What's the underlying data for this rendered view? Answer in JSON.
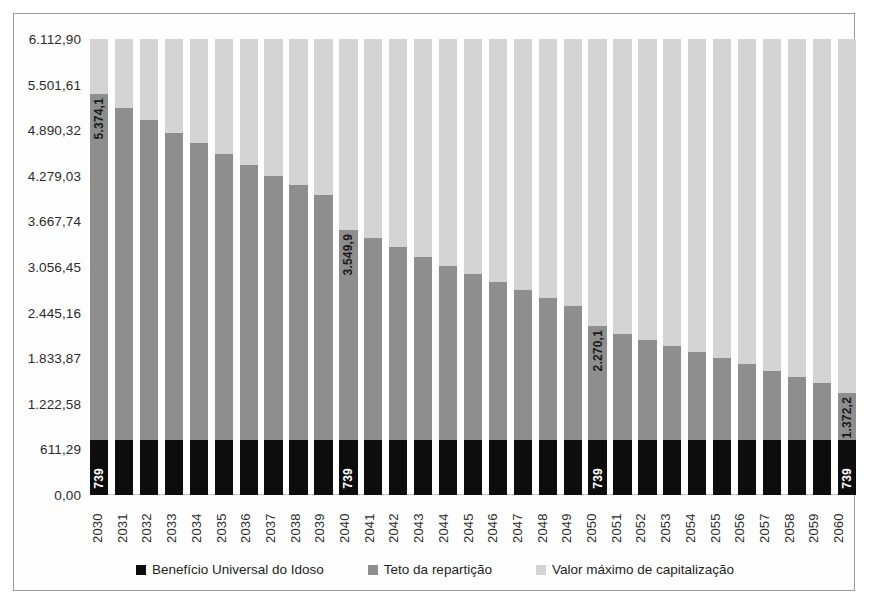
{
  "chart_data": {
    "type": "bar",
    "subtype": "stacked-column",
    "title": "",
    "xlabel": "",
    "ylabel": "",
    "ylim": [
      0,
      6112.9
    ],
    "ytick_labels": [
      "0,00",
      "611,29",
      "1.222,58",
      "1.833,87",
      "2.445,16",
      "3.056,45",
      "3.667,74",
      "4.279,03",
      "4.890,32",
      "5.501,61",
      "6.112,90"
    ],
    "ytick_values": [
      0,
      611.29,
      1222.58,
      1833.87,
      2445.16,
      3056.45,
      3667.74,
      4279.03,
      4890.32,
      5501.61,
      6112.9
    ],
    "grid": false,
    "legend_position": "bottom",
    "categories": [
      "2030",
      "2031",
      "2032",
      "2033",
      "2034",
      "2035",
      "2036",
      "2037",
      "2038",
      "2039",
      "2040",
      "2041",
      "2042",
      "2043",
      "2044",
      "2045",
      "2046",
      "2047",
      "2048",
      "2049",
      "2050",
      "2051",
      "2052",
      "2053",
      "2054",
      "2055",
      "2056",
      "2057",
      "2058",
      "2059",
      "2060"
    ],
    "series": [
      {
        "name": "Benefício Universal do Idoso",
        "color": "#0d0d0d",
        "values": [
          739,
          739,
          739,
          739,
          739,
          739,
          739,
          739,
          739,
          739,
          739,
          739,
          739,
          739,
          739,
          739,
          739,
          739,
          739,
          739,
          739,
          739,
          739,
          739,
          739,
          739,
          739,
          739,
          739,
          739,
          739
        ]
      },
      {
        "name": "Teto da repartição",
        "color": "#8e8e8e",
        "values": [
          4635.1,
          4452.3,
          4285.0,
          4117.8,
          3977.3,
          3836.8,
          3682.3,
          3541.8,
          3420.0,
          3285.0,
          2810.9,
          2702.0,
          2580.2,
          2458.4,
          2336.6,
          2228.0,
          2119.4,
          2010.8,
          1902.2,
          1793.6,
          1531.1,
          1422.5,
          1340.0,
          1258.0,
          1176.0,
          1094.0,
          1012.0,
          930.0,
          848.0,
          766.0,
          633.2
        ]
      },
      {
        "name": "Valor máximo de capitalização",
        "color": "#d4d4d4",
        "values": [
          738.7,
          921.6,
          1088.9,
          1256.1,
          1396.6,
          1537.1,
          1691.6,
          1832.1,
          1953.9,
          2088.9,
          2563.0,
          2671.9,
          2793.7,
          2915.5,
          3037.3,
          3145.9,
          3254.5,
          3363.1,
          3471.7,
          3580.3,
          3842.8,
          3951.4,
          4033.9,
          4115.9,
          4197.9,
          4279.9,
          4361.9,
          4443.9,
          4525.9,
          4607.9,
          4740.7
        ]
      }
    ],
    "stack_totals": [
      6112.9,
      6112.9,
      6112.9,
      6112.9,
      6112.9,
      6112.9,
      6112.9,
      6112.9,
      6112.9,
      6112.9,
      6112.9,
      6112.9,
      6112.9,
      6112.9,
      6112.9,
      6112.9,
      6112.9,
      6112.9,
      6112.9,
      6112.9,
      6112.9,
      6112.9,
      6112.9,
      6112.9,
      6112.9,
      6112.9,
      6112.9,
      6112.9,
      6112.9,
      6112.9,
      6112.9
    ],
    "data_labels": {
      "teto_top": {
        "2030": "5.374,1",
        "2040": "3.549,9",
        "2050": "2.270,1",
        "2060": "1.372,2"
      },
      "beneficio": {
        "2030": "739",
        "2040": "739",
        "2050": "739",
        "2060": "739"
      }
    }
  },
  "legend": {
    "items": [
      {
        "label": "Benefício Universal do Idoso",
        "swatch": "sw-ben"
      },
      {
        "label": "Teto da repartição",
        "swatch": "sw-teto"
      },
      {
        "label": "Valor máximo de capitalização",
        "swatch": "sw-cap"
      }
    ]
  }
}
